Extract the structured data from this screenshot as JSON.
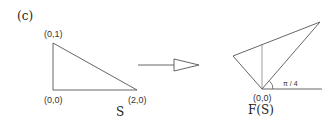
{
  "panel_label": "(c)",
  "left_figure": {
    "name": "S",
    "vertices": [
      {
        "label": "(0,1)",
        "x": 53,
        "y": 43
      },
      {
        "label": "(0,0)",
        "x": 53,
        "y": 90
      },
      {
        "label": "(2,0)",
        "x": 137,
        "y": 90
      }
    ]
  },
  "arrow": {
    "from_x": 137,
    "to_x": 199,
    "y": 65
  },
  "right_figure": {
    "name": "F(S)",
    "origin_label": "(0,0)",
    "angle_label": "π / 4",
    "vertices": [
      {
        "x": 262,
        "y": 89
      },
      {
        "x": 233,
        "y": 56
      },
      {
        "x": 320,
        "y": 22
      }
    ]
  },
  "colors": {
    "stroke": "#555555",
    "text": "#333333"
  }
}
